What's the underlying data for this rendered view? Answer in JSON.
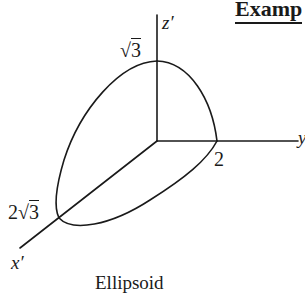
{
  "heading": {
    "text": "Examp"
  },
  "diagram": {
    "title": "Ellipsoid",
    "axes": {
      "z": {
        "label": "z′"
      },
      "y": {
        "label": "y"
      },
      "x": {
        "label": "x′"
      }
    },
    "intercepts": {
      "z": {
        "coef": "",
        "radical": "3",
        "display": "√3"
      },
      "y": {
        "value": "2"
      },
      "x": {
        "coef": "2",
        "radical": "3",
        "display": "2√3"
      }
    },
    "colors": {
      "stroke": "#1a1a1a",
      "background": "#ffffff"
    }
  }
}
